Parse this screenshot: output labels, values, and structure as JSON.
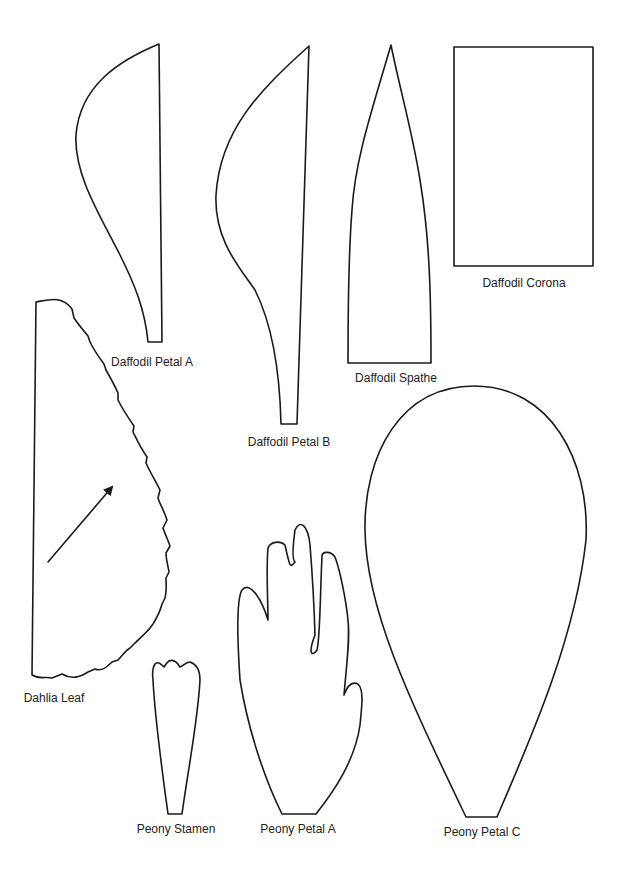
{
  "page": {
    "background": "#ffffff",
    "stroke_color": "#1a1a1a"
  },
  "templates": [
    {
      "id": "daffodil-petal-a",
      "label": "Daffodil Petal A"
    },
    {
      "id": "daffodil-petal-b",
      "label": "Daffodil Petal B"
    },
    {
      "id": "daffodil-spathe",
      "label": "Daffodil Spathe"
    },
    {
      "id": "daffodil-corona",
      "label": "Daffodil Corona"
    },
    {
      "id": "dahlia-leaf",
      "label": "Dahlia Leaf"
    },
    {
      "id": "peony-stamen",
      "label": "Peony Stamen"
    },
    {
      "id": "peony-petal-a",
      "label": "Peony Petal A"
    },
    {
      "id": "peony-petal-c",
      "label": "Peony Petal C"
    }
  ]
}
